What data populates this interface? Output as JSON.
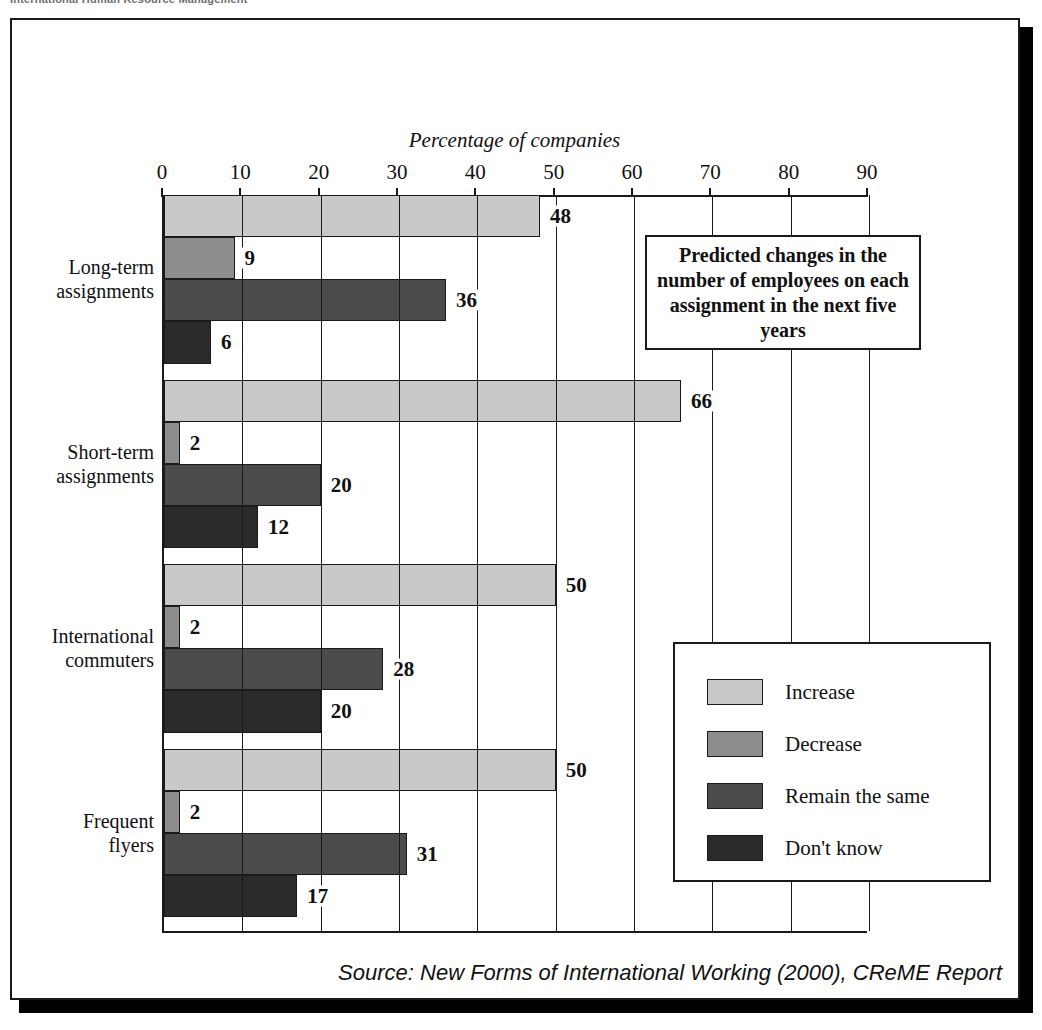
{
  "page": {
    "cropped_header": "International Human Resource Management"
  },
  "source_note": "Source: New Forms of International Working (2000), CReME Report",
  "annotation": {
    "text": "Predicted changes in the number of employees on each assignment in the next five years"
  },
  "colors": {
    "increase": "#c9c9c9",
    "decrease": "#8d8d8d",
    "remain": "#4b4b4b",
    "dont_know": "#2b2b2b",
    "frame": "#1a1a1a",
    "background": "#ffffff"
  },
  "chart_data": {
    "type": "bar",
    "orientation": "horizontal",
    "title": "Percentage of companies",
    "xlabel": "Percentage of companies",
    "ylabel": "",
    "xlim": [
      0,
      90
    ],
    "xticks": [
      0,
      10,
      20,
      30,
      40,
      50,
      60,
      70,
      80,
      90
    ],
    "ticklabels": [
      "0",
      "10",
      "20",
      "30",
      "40",
      "50",
      "60",
      "70",
      "80",
      "90"
    ],
    "grid": true,
    "legend_position": "bottom-right",
    "categories": [
      "Long-term assignments",
      "Short-term assignments",
      "International commuters",
      "Frequent flyers"
    ],
    "category_lines": [
      [
        "Long-term",
        "assignments"
      ],
      [
        "Short-term",
        "assignments"
      ],
      [
        "International",
        "commuters"
      ],
      [
        "Frequent",
        "flyers"
      ]
    ],
    "series": [
      {
        "name": "Increase",
        "color": "#c9c9c9",
        "values": [
          48,
          66,
          50,
          50
        ]
      },
      {
        "name": "Decrease",
        "color": "#8d8d8d",
        "values": [
          9,
          2,
          2,
          2
        ]
      },
      {
        "name": "Remain the same",
        "color": "#4b4b4b",
        "values": [
          36,
          20,
          28,
          31
        ]
      },
      {
        "name": "Don't know",
        "color": "#2b2b2b",
        "values": [
          6,
          12,
          20,
          17
        ]
      }
    ]
  }
}
